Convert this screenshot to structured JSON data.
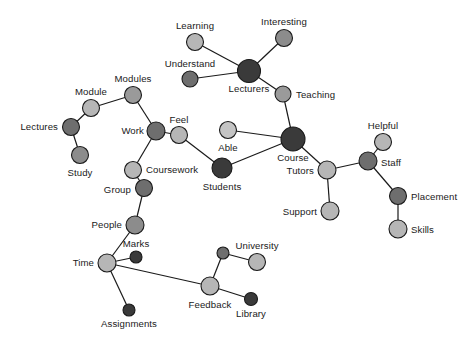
{
  "figure": {
    "type": "network-graph",
    "title": "",
    "background_color": "#ffffff",
    "edge_color": "#1a1a1a",
    "label_color": "#1a1a1a",
    "node_palette": {
      "dark": "#3a3a3a",
      "mid_dark": "#6e6e6e",
      "mid": "#8c8c8c",
      "light": "#b6b6b6",
      "lighter": "#c4c4c4"
    }
  },
  "chart_data": {
    "type": "scatter",
    "title": "",
    "xlabel": "",
    "ylabel": "",
    "nodes": [
      {
        "id": "learning",
        "label": "Learning",
        "x": 195,
        "y": 42,
        "r": 8.5,
        "color": "#b6b6b6",
        "label_dx": 0,
        "label_dy": -13,
        "anchor": "middle"
      },
      {
        "id": "interesting",
        "label": "Interesting",
        "x": 284,
        "y": 38,
        "r": 8.5,
        "color": "#8c8c8c",
        "label_dx": 0,
        "label_dy": -13,
        "anchor": "middle"
      },
      {
        "id": "understand",
        "label": "Understand",
        "x": 190,
        "y": 79,
        "r": 8.0,
        "color": "#6e6e6e",
        "label_dx": 0,
        "label_dy": -12,
        "anchor": "middle"
      },
      {
        "id": "lecturers",
        "label": "Lecturers",
        "x": 249,
        "y": 71,
        "r": 11.5,
        "color": "#3a3a3a",
        "label_dx": 0,
        "label_dy": 21,
        "anchor": "middle"
      },
      {
        "id": "teaching",
        "label": "Teaching",
        "x": 283,
        "y": 94,
        "r": 8.0,
        "color": "#9a9a9a",
        "label_dx": 13,
        "label_dy": 4,
        "anchor": "start"
      },
      {
        "id": "modules",
        "label": "Modules",
        "x": 133,
        "y": 95,
        "r": 8.5,
        "color": "#9a9a9a",
        "label_dx": 0,
        "label_dy": -13,
        "anchor": "middle"
      },
      {
        "id": "module",
        "label": "Module",
        "x": 91,
        "y": 108,
        "r": 8.5,
        "color": "#b6b6b6",
        "label_dx": 0,
        "label_dy": -13,
        "anchor": "middle"
      },
      {
        "id": "lectures",
        "label": "Lectures",
        "x": 71,
        "y": 127,
        "r": 8.5,
        "color": "#6e6e6e",
        "label_dx": -13,
        "label_dy": 3,
        "anchor": "end"
      },
      {
        "id": "study",
        "label": "Study",
        "x": 80,
        "y": 155,
        "r": 8.5,
        "color": "#8c8c8c",
        "label_dx": 0,
        "label_dy": 21,
        "anchor": "middle"
      },
      {
        "id": "work",
        "label": "Work",
        "x": 156,
        "y": 131,
        "r": 9.0,
        "color": "#6e6e6e",
        "label_dx": -12,
        "label_dy": 3,
        "anchor": "end"
      },
      {
        "id": "feel",
        "label": "Feel",
        "x": 179,
        "y": 135,
        "r": 8.5,
        "color": "#b6b6b6",
        "label_dx": 0,
        "label_dy": -12,
        "anchor": "middle"
      },
      {
        "id": "able",
        "label": "Able",
        "x": 228,
        "y": 130,
        "r": 8.5,
        "color": "#c4c4c4",
        "label_dx": 0,
        "label_dy": 21,
        "anchor": "middle"
      },
      {
        "id": "course",
        "label": "Course",
        "x": 293,
        "y": 139,
        "r": 12.0,
        "color": "#3a3a3a",
        "label_dx": 0,
        "label_dy": 22,
        "anchor": "middle"
      },
      {
        "id": "students",
        "label": "Students",
        "x": 222,
        "y": 168,
        "r": 10.0,
        "color": "#3a3a3a",
        "label_dx": 0,
        "label_dy": 22,
        "anchor": "middle"
      },
      {
        "id": "coursework",
        "label": "Coursework",
        "x": 133,
        "y": 170,
        "r": 8.5,
        "color": "#b6b6b6",
        "label_dx": 13,
        "label_dy": 3,
        "anchor": "start"
      },
      {
        "id": "group",
        "label": "Group",
        "x": 144,
        "y": 188,
        "r": 8.5,
        "color": "#6e6e6e",
        "label_dx": -13,
        "label_dy": 5,
        "anchor": "end"
      },
      {
        "id": "people",
        "label": "People",
        "x": 135,
        "y": 225,
        "r": 9.0,
        "color": "#8c8c8c",
        "label_dx": -13,
        "label_dy": 3,
        "anchor": "end"
      },
      {
        "id": "time",
        "label": "Time",
        "x": 107,
        "y": 263,
        "r": 9.0,
        "color": "#b6b6b6",
        "label_dx": -13,
        "label_dy": 3,
        "anchor": "end"
      },
      {
        "id": "marks",
        "label": "Marks",
        "x": 136,
        "y": 257,
        "r": 6.0,
        "color": "#3a3a3a",
        "label_dx": 0,
        "label_dy": -10,
        "anchor": "middle"
      },
      {
        "id": "assignments",
        "label": "Assignments",
        "x": 129,
        "y": 310,
        "r": 6.0,
        "color": "#3a3a3a",
        "label_dx": 0,
        "label_dy": 17,
        "anchor": "middle"
      },
      {
        "id": "feedback",
        "label": "Feedback",
        "x": 210,
        "y": 286,
        "r": 9.0,
        "color": "#b6b6b6",
        "label_dx": 0,
        "label_dy": 22,
        "anchor": "middle"
      },
      {
        "id": "univ-hub",
        "label": "",
        "x": 223,
        "y": 253,
        "r": 6.0,
        "color": "#6e6e6e",
        "label_dx": 0,
        "label_dy": 0,
        "anchor": "middle"
      },
      {
        "id": "university",
        "label": "University",
        "x": 257,
        "y": 262,
        "r": 8.5,
        "color": "#b6b6b6",
        "label_dx": 0,
        "label_dy": -13,
        "anchor": "middle"
      },
      {
        "id": "library",
        "label": "Library",
        "x": 251,
        "y": 299,
        "r": 6.5,
        "color": "#3a3a3a",
        "label_dx": 0,
        "label_dy": 18,
        "anchor": "middle"
      },
      {
        "id": "tutors",
        "label": "Tutors",
        "x": 327,
        "y": 170,
        "r": 9.0,
        "color": "#b6b6b6",
        "label_dx": -13,
        "label_dy": 4,
        "anchor": "end"
      },
      {
        "id": "support",
        "label": "Support",
        "x": 330,
        "y": 211,
        "r": 9.0,
        "color": "#b6b6b6",
        "label_dx": -13,
        "label_dy": 4,
        "anchor": "end"
      },
      {
        "id": "staff",
        "label": "Staff",
        "x": 368,
        "y": 161,
        "r": 9.0,
        "color": "#6e6e6e",
        "label_dx": 13,
        "label_dy": 5,
        "anchor": "start"
      },
      {
        "id": "helpful",
        "label": "Helpful",
        "x": 383,
        "y": 142,
        "r": 8.5,
        "color": "#b6b6b6",
        "label_dx": 0,
        "label_dy": -13,
        "anchor": "middle"
      },
      {
        "id": "placement",
        "label": "Placement",
        "x": 398,
        "y": 196,
        "r": 8.5,
        "color": "#6e6e6e",
        "label_dx": 13,
        "label_dy": 4,
        "anchor": "start"
      },
      {
        "id": "skills",
        "label": "Skills",
        "x": 398,
        "y": 229,
        "r": 9.0,
        "color": "#b6b6b6",
        "label_dx": 13,
        "label_dy": 4,
        "anchor": "start"
      }
    ],
    "edges": [
      {
        "source": "learning",
        "target": "lecturers"
      },
      {
        "source": "interesting",
        "target": "lecturers"
      },
      {
        "source": "understand",
        "target": "lecturers"
      },
      {
        "source": "lecturers",
        "target": "teaching"
      },
      {
        "source": "teaching",
        "target": "course"
      },
      {
        "source": "module",
        "target": "modules"
      },
      {
        "source": "module",
        "target": "lectures"
      },
      {
        "source": "lectures",
        "target": "study"
      },
      {
        "source": "modules",
        "target": "work"
      },
      {
        "source": "work",
        "target": "feel"
      },
      {
        "source": "work",
        "target": "coursework"
      },
      {
        "source": "feel",
        "target": "students"
      },
      {
        "source": "able",
        "target": "course"
      },
      {
        "source": "students",
        "target": "course"
      },
      {
        "source": "coursework",
        "target": "group"
      },
      {
        "source": "group",
        "target": "people"
      },
      {
        "source": "people",
        "target": "time"
      },
      {
        "source": "time",
        "target": "marks"
      },
      {
        "source": "time",
        "target": "assignments"
      },
      {
        "source": "time",
        "target": "feedback"
      },
      {
        "source": "feedback",
        "target": "univ-hub"
      },
      {
        "source": "univ-hub",
        "target": "university"
      },
      {
        "source": "feedback",
        "target": "library"
      },
      {
        "source": "course",
        "target": "tutors"
      },
      {
        "source": "tutors",
        "target": "support"
      },
      {
        "source": "tutors",
        "target": "staff"
      },
      {
        "source": "staff",
        "target": "helpful"
      },
      {
        "source": "staff",
        "target": "placement"
      },
      {
        "source": "placement",
        "target": "skills"
      }
    ]
  }
}
